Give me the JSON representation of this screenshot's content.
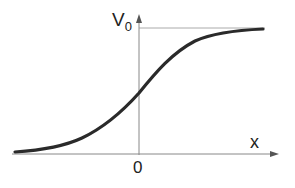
{
  "labels": {
    "y_axis_main": "V",
    "y_axis_sub": "0",
    "x_axis": "x",
    "origin": "0"
  },
  "curve": {
    "type": "sigmoid",
    "description": "smooth S-shaped curve rising from near 0 at left to asymptote V0 at right, passing through V0/2 at x=0"
  },
  "colors": {
    "curve": "#2a2a2a",
    "axes": "#888888",
    "asymptote": "#aaaaaa",
    "text": "#222222"
  }
}
